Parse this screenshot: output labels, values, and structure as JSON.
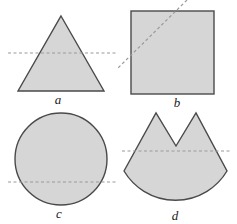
{
  "figures": [
    {
      "id": "a",
      "label": "a",
      "shape": "triangle",
      "cut_line": "horizontal dashed line through lower-middle"
    },
    {
      "id": "b",
      "label": "b",
      "shape": "square",
      "cut_line": "diagonal dashed line across upper-left corner"
    },
    {
      "id": "c",
      "label": "c",
      "shape": "circle",
      "cut_line": "horizontal dashed line below center"
    },
    {
      "id": "d",
      "label": "d",
      "shape": "two-peaked sector (circular arc base with V notch on top)",
      "cut_line": "horizontal dashed line below notch"
    }
  ],
  "colors": {
    "fill": "#d6d6d6",
    "stroke": "#4a4a4a",
    "dash": "#9a9a9a"
  }
}
